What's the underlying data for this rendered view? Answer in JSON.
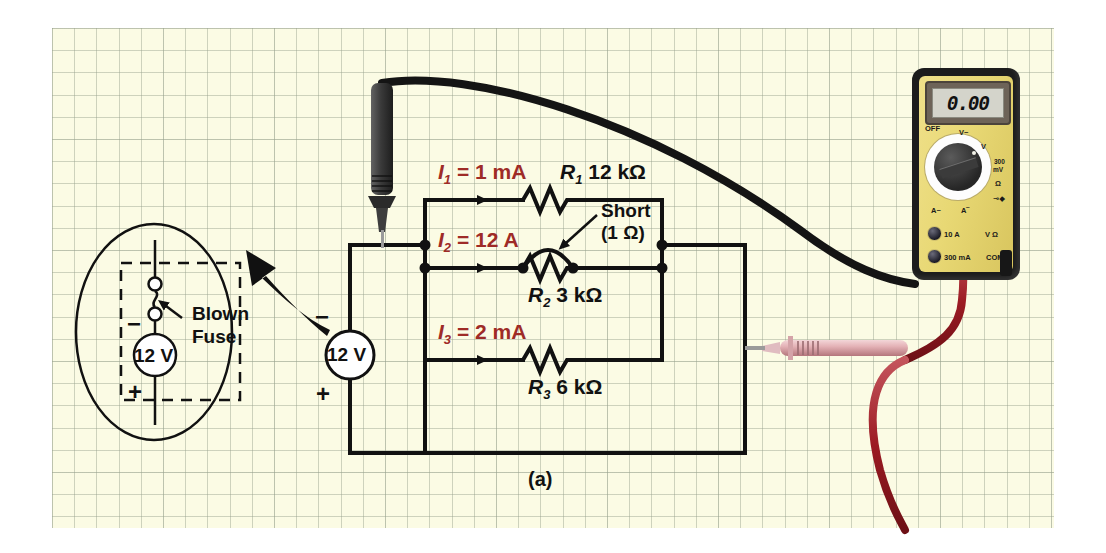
{
  "figure": {
    "caption": "(a)"
  },
  "circuit": {
    "source": {
      "value": "12 V",
      "plus": "+",
      "minus": "−"
    },
    "branches": [
      {
        "current_label": "I",
        "current_sub": "1",
        "current_value": "= 1 mA",
        "resistor": "R",
        "resistor_sub": "1",
        "resistance": "12 kΩ"
      },
      {
        "current_label": "I",
        "current_sub": "2",
        "current_value": "= 12 A",
        "resistor": "R",
        "resistor_sub": "2",
        "resistance": "3 kΩ"
      },
      {
        "current_label": "I",
        "current_sub": "3",
        "current_value": "= 2 mA",
        "resistor": "R",
        "resistor_sub": "3",
        "resistance": "6 kΩ"
      }
    ],
    "fault_callout": {
      "title": "Short",
      "value": "(1 Ω)"
    }
  },
  "inset": {
    "label_line1": "Blown",
    "label_line2": "Fuse",
    "source_value": "12 V",
    "plus": "+",
    "minus": "−"
  },
  "meter": {
    "display": "0.00",
    "dial": {
      "off": "OFF",
      "ac_volts": "V~",
      "dc_volts": "V",
      "dc_volts_sup": "‾",
      "millivolts_line1": "300",
      "millivolts_line2": "mV",
      "ohms": "Ω",
      "diode": "⊸◆",
      "ac_amps": "A~",
      "dc_amps": "A‾"
    },
    "terminals": {
      "ten_amp": "10 A",
      "three_hundred_ma": "300 mA",
      "volts_ohms": "V Ω",
      "common": "COM"
    }
  },
  "colors": {
    "paper": "#fbfbe4",
    "grid": "#96a08c",
    "wire": "#111111",
    "current_text": "#9e2b27",
    "red_lead": "#9c1b23",
    "meter_face": "#e8d874"
  }
}
